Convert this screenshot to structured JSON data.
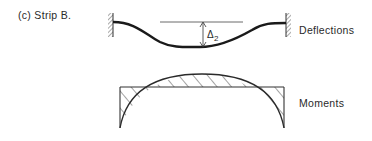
{
  "caption": "(c) Strip B.",
  "deflection": {
    "label": "Deflections",
    "delta_symbol": "Δ",
    "delta_subscript": "2"
  },
  "moment": {
    "label": "Moments"
  },
  "colors": {
    "ink": "#2a2a2a",
    "background": "#ffffff"
  }
}
